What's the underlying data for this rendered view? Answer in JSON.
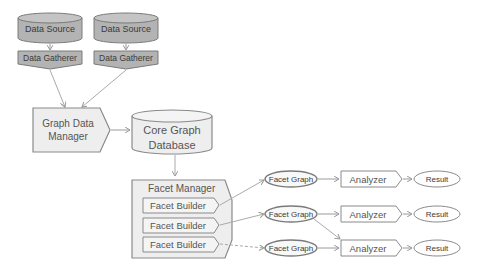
{
  "diagram": {
    "sources": [
      {
        "label": "Data Source",
        "gatherer": "Data Gatherer"
      },
      {
        "label": "Data Source",
        "gatherer": "Data Gatherer"
      }
    ],
    "graph_data_manager": {
      "line1": "Graph Data",
      "line2": "Manager"
    },
    "core_graph_database": {
      "line1": "Core Graph",
      "line2": "Database"
    },
    "facet_manager": {
      "title": "Facet Manager",
      "builders": [
        "Facet Builder",
        "Facet Builder",
        "Facet Builder"
      ]
    },
    "pipelines": [
      {
        "facet_graph": "Facet Graph",
        "analyzer": "Analyzer",
        "result": "Result"
      },
      {
        "facet_graph": "Facet Graph",
        "analyzer": "Analyzer",
        "result": "Result"
      },
      {
        "facet_graph": "Facet Graph",
        "analyzer": "Analyzer",
        "result": "Result"
      }
    ],
    "colors": {
      "dark_fill": "#b5b5b5",
      "light_fill": "#eeeeee",
      "stroke": "#8a8a8a",
      "arrow": "#aaaaaa"
    }
  }
}
